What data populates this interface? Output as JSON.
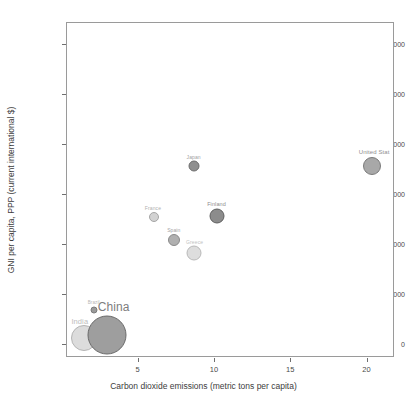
{
  "chart_data": {
    "type": "scatter",
    "title": "",
    "subtitle": "",
    "xlabel": "Carbon dioxide emissions (metric tons per capita)",
    "ylabel": "GNI per capita, PPP (current international $)",
    "xlim": [
      0.3,
      21.8
    ],
    "ylim": [
      -2600,
      64500
    ],
    "xticks": [
      5,
      10,
      15,
      20
    ],
    "xtick_labels": [
      "5",
      "10",
      "15",
      "20"
    ],
    "yticks": [
      0,
      10000,
      20000,
      30000,
      40000,
      50000,
      60000
    ],
    "ytick_labels": [
      "0",
      "10000",
      "20000",
      "30000",
      "40000",
      "50000",
      "60000"
    ],
    "grid": false,
    "legend": "none",
    "size_encodes": "population",
    "points": [
      {
        "label": "India",
        "x": 1.4,
        "y": 1500,
        "bubble_px": 26,
        "fill": "#dcdcdc",
        "stroke": "#b4b4b4",
        "label_dx": -4,
        "label_dy": -12,
        "label_size": 7.5,
        "label_color": "#bdbdbd"
      },
      {
        "label": "China",
        "x": 2.9,
        "y": 2000,
        "bubble_px": 39,
        "fill": "#9e9e9e",
        "stroke": "#6a6a6a",
        "label_dx": 7,
        "label_dy": -21,
        "label_size": 12,
        "label_color": "#7d7d7d"
      },
      {
        "label": "Brazil",
        "x": 2.05,
        "y": 7000,
        "bubble_px": 7,
        "fill": "#9a9a9a",
        "stroke": "#7b7b7b",
        "label_dx": 0,
        "label_dy": -5,
        "label_size": 4.5,
        "label_color": "#b6b6b6"
      },
      {
        "label": "France",
        "x": 6.0,
        "y": 25600,
        "bubble_px": 10,
        "fill": "#d2d2d2",
        "stroke": "#a6a6a6",
        "label_dx": -1,
        "label_dy": -6,
        "label_size": 5,
        "label_color": "#b0b0b0"
      },
      {
        "label": "Spain",
        "x": 7.3,
        "y": 21100,
        "bubble_px": 12,
        "fill": "#b0b0b0",
        "stroke": "#8a8a8a",
        "label_dx": 0,
        "label_dy": -7,
        "label_size": 5,
        "label_color": "#a4a4a4"
      },
      {
        "label": "Greece",
        "x": 8.6,
        "y": 18400,
        "bubble_px": 15,
        "fill": "#dddddd",
        "stroke": "#b9b9b9",
        "label_dx": 1,
        "label_dy": -8,
        "label_size": 5,
        "label_color": "#c2c2c2"
      },
      {
        "label": "Japan",
        "x": 8.6,
        "y": 35900,
        "bubble_px": 11,
        "fill": "#8f8f8f",
        "stroke": "#6d6d6d",
        "label_dx": 0,
        "label_dy": -6,
        "label_size": 5,
        "label_color": "#9f9f9f"
      },
      {
        "label": "Finland",
        "x": 10.1,
        "y": 25800,
        "bubble_px": 15,
        "fill": "#8c8c8c",
        "stroke": "#5f5f5f",
        "label_dx": 0,
        "label_dy": -9,
        "label_size": 5.5,
        "label_color": "#8d8d8d"
      },
      {
        "label": "United Stat",
        "x": 20.3,
        "y": 35800,
        "bubble_px": 18,
        "fill": "#a8a8a8",
        "stroke": "#7a7a7a",
        "label_dx": 2,
        "label_dy": -11,
        "label_size": 6,
        "label_color": "#8f8f8f"
      }
    ]
  },
  "frame": {
    "border_color": "#9a9a9a",
    "background": "#ffffff"
  }
}
